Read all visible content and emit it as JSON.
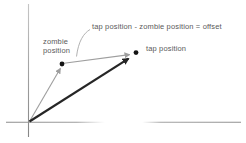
{
  "diagram": {
    "labels": {
      "offset_formula": "tap position - zombie position = offset",
      "zombie_line1": "zombie",
      "zombie_line2": "position",
      "tap": "tap position"
    },
    "colors": {
      "background": "#ffffff",
      "axis": "#8f8f8f",
      "vector_primary": "#262626",
      "vector_secondary": "#9e9e9e",
      "callout_line": "#b2b2b2",
      "point": "#141414",
      "text": "#5a5a5a"
    }
  }
}
